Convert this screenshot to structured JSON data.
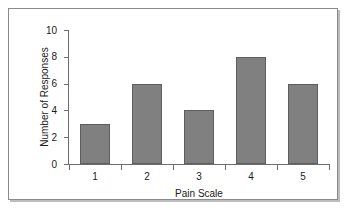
{
  "chart_data": {
    "type": "bar",
    "title": "",
    "xlabel": "Pain Scale",
    "ylabel": "Number of Responses",
    "categories": [
      "1",
      "2",
      "3",
      "4",
      "5"
    ],
    "values": [
      3,
      6,
      4,
      8,
      6
    ],
    "ylim": [
      0,
      10
    ],
    "yticks": [
      0,
      2,
      4,
      6,
      8,
      10
    ],
    "ytick_labels": [
      "0",
      "2",
      "4",
      "6",
      "8",
      "10"
    ],
    "grid": false,
    "legend": null,
    "bar_color": "#808080",
    "bar_edge_color": "#5e5e5e",
    "axis_color": "#6e6e6e",
    "text_color": "#1a1a1a",
    "background": "#ffffff",
    "frame_border_color": "#8a8a8a",
    "frame_shadow_color": "#bdbdbd"
  }
}
